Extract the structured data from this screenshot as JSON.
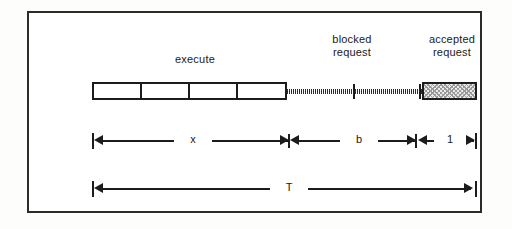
{
  "figure": {
    "kind": "timeline-diagram",
    "background_color": "#ffffff",
    "ink_color": "#1c1c1c",
    "frame": {
      "border_color": "#2b2b2b"
    }
  },
  "labels": {
    "execute": "execute",
    "blocked_request": "blocked\nrequest",
    "accepted_request": "accepted\nrequest"
  },
  "timeline": {
    "execute_segments": [
      {
        "name": "execute-segment-1"
      },
      {
        "name": "execute-segment-2"
      },
      {
        "name": "execute-segment-3"
      },
      {
        "name": "execute-segment-4"
      }
    ],
    "dotted_runs": [
      {
        "name": "waiting-run-1"
      },
      {
        "name": "waiting-run-2"
      },
      {
        "name": "waiting-run-3"
      }
    ],
    "tick_marks": [
      {
        "name": "blocked-request-tick-1"
      },
      {
        "name": "blocked-request-tick-2"
      }
    ],
    "accepted_box": {
      "name": "accepted-request-box",
      "fill": "stipple"
    }
  },
  "dimensions": [
    {
      "id": "x",
      "label": "x"
    },
    {
      "id": "b",
      "label": "b"
    },
    {
      "id": "one",
      "label": "1"
    },
    {
      "id": "T",
      "label": "T"
    }
  ]
}
